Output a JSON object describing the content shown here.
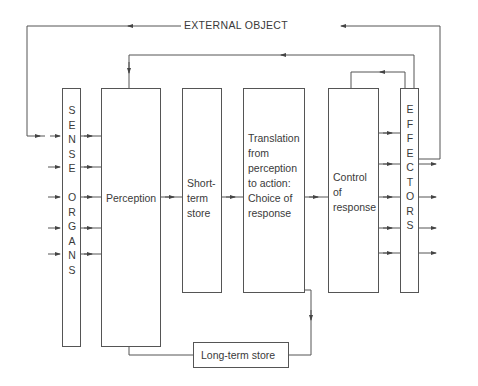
{
  "diagram": {
    "external_object": "EXTERNAL OBJECT",
    "sense_organs": {
      "letters": [
        "S",
        "E",
        "N",
        "S",
        "E",
        " ",
        "O",
        "R",
        "G",
        "A",
        "N",
        "S"
      ]
    },
    "effectors": {
      "letters": [
        "E",
        "F",
        "F",
        "E",
        "C",
        "T",
        "O",
        "R",
        "S"
      ]
    },
    "perception": "Perception",
    "short_term_store": "Short-\nterm\nstore",
    "translation": "Translation\nfrom\nperception\nto action:\nChoice of\nresponse",
    "control_of_response": "Control\nof\nresponse",
    "long_term_store": "Long-term store"
  },
  "colors": {
    "line": "#555555",
    "text": "#3a3a3a",
    "background": "#ffffff"
  }
}
